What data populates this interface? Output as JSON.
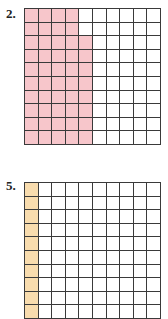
{
  "problems": [
    {
      "label": "2.",
      "rows": 10,
      "cols": 10,
      "shade_color": "#f7c6cb",
      "shaded_per_row": [
        4,
        4,
        5,
        5,
        5,
        5,
        5,
        5,
        5,
        5
      ],
      "shaded_total": 48,
      "top": 8,
      "visible_rows": 10
    },
    {
      "label": "5.",
      "rows": 10,
      "cols": 10,
      "shade_color": "#f8dcae",
      "shaded_per_row": [
        1,
        1,
        1,
        1,
        1,
        1,
        1,
        1,
        1,
        1
      ],
      "shaded_total": 10,
      "top": 182,
      "visible_rows": 8
    }
  ]
}
